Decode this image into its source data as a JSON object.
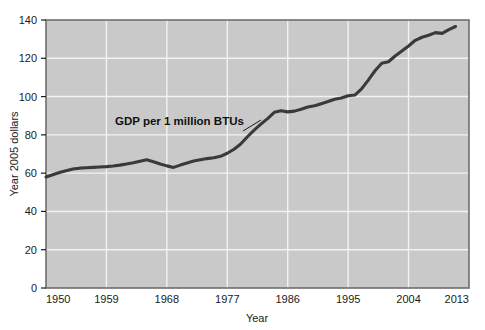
{
  "chart_data": {
    "type": "line",
    "title": "",
    "xlabel": "Year",
    "ylabel": "Year 2005 dollars",
    "xlim": [
      1950,
      2013
    ],
    "ylim": [
      0,
      140
    ],
    "grid": true,
    "legend_position": "none",
    "xticks": [
      "1950",
      "1959",
      "1968",
      "1977",
      "1986",
      "1995",
      "2004",
      "2013"
    ],
    "xtick_values": [
      1950,
      1959,
      1968,
      1977,
      1986,
      1995,
      2004,
      2013
    ],
    "yticks": [
      "0",
      "20",
      "40",
      "60",
      "80",
      "100",
      "120",
      "140"
    ],
    "ytick_values": [
      0,
      20,
      40,
      60,
      80,
      100,
      120,
      140
    ],
    "annotations": [
      {
        "text": "GDP per 1 million BTUs",
        "x": 1967,
        "y": 84
      }
    ],
    "series": [
      {
        "name": "GDP per 1 million BTUs",
        "color": "#3a3a3a",
        "x": [
          1950,
          1951,
          1952,
          1953,
          1954,
          1955,
          1956,
          1957,
          1958,
          1959,
          1960,
          1961,
          1962,
          1963,
          1964,
          1965,
          1966,
          1967,
          1968,
          1969,
          1970,
          1971,
          1972,
          1973,
          1974,
          1975,
          1976,
          1977,
          1978,
          1979,
          1980,
          1981,
          1982,
          1983,
          1984,
          1985,
          1986,
          1987,
          1988,
          1989,
          1990,
          1991,
          1992,
          1993,
          1994,
          1995,
          1996,
          1997,
          1998,
          1999,
          2000,
          2001,
          2002,
          2003,
          2004,
          2005,
          2006,
          2007,
          2008,
          2009,
          2010,
          2011
        ],
        "values": [
          58.0,
          59.2,
          60.3,
          61.3,
          62.2,
          62.6,
          62.8,
          63.0,
          63.2,
          63.4,
          63.7,
          64.2,
          64.8,
          65.4,
          66.2,
          67.0,
          66.0,
          64.8,
          63.8,
          63.0,
          64.2,
          65.3,
          66.3,
          67.0,
          67.6,
          68.0,
          68.8,
          70.4,
          72.5,
          75.2,
          79.0,
          82.5,
          85.6,
          88.5,
          91.8,
          92.6,
          92.0,
          92.4,
          93.4,
          94.6,
          95.2,
          96.3,
          97.4,
          98.6,
          99.3,
          100.4,
          100.8,
          104.0,
          108.6,
          113.5,
          117.4,
          118.2,
          121.2,
          123.8,
          126.4,
          129.4,
          131.0,
          132.0,
          133.4,
          133.0,
          135.0,
          136.6
        ]
      }
    ]
  },
  "colors": {
    "plot_background": "#c9c9c9",
    "grid": "#f2f2f2",
    "line": "#3a3a3a",
    "axis_border": "#6f6f6f",
    "text": "#1a1a1a",
    "page_background": "#ffffff"
  }
}
